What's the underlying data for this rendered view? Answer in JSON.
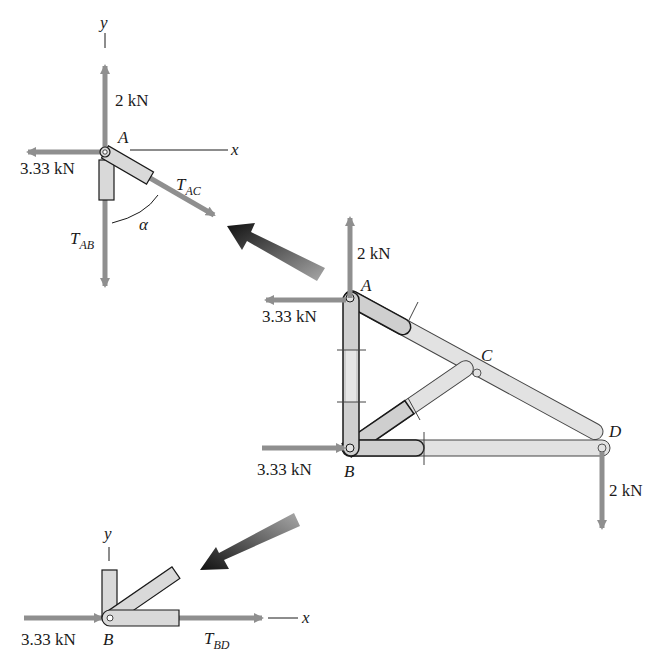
{
  "diagram": {
    "colors": {
      "force_arrow": "#8f8f8f",
      "member_fill": "#d9d9d9",
      "member_outline": "#1a1a1a",
      "pointer_dark": "#111111",
      "pointer_light": "#9a9a9a"
    },
    "truss": {
      "joints": {
        "A": "A",
        "B": "B",
        "C": "C",
        "D": "D"
      },
      "loads": {
        "A_vertical": "2 kN",
        "A_horizontal": "3.33 kN",
        "B_horizontal": "3.33 kN",
        "D_vertical": "2 kN"
      }
    },
    "fbd_A": {
      "joint": "A",
      "x_axis": "x",
      "y_axis": "y",
      "vertical_force": "2 kN",
      "horizontal_force": "3.33 kN",
      "tension_ac": {
        "main": "T",
        "sub": "AC"
      },
      "tension_ab": {
        "main": "T",
        "sub": "AB"
      },
      "angle": "α"
    },
    "fbd_B": {
      "joint": "B",
      "x_axis": "x",
      "y_axis": "y",
      "horizontal_force": "3.33 kN",
      "tension_bd": {
        "main": "T",
        "sub": "BD"
      }
    }
  }
}
